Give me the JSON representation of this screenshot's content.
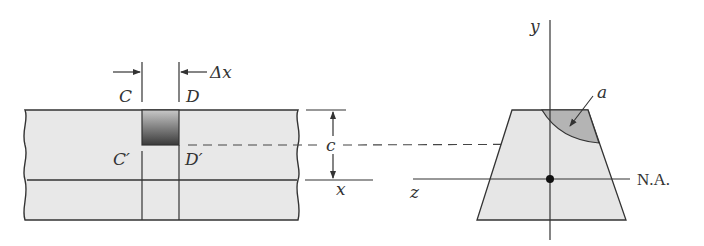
{
  "figure": {
    "type": "engineering diagram"
  },
  "beam": {
    "labels": {
      "C": "C",
      "D": "D",
      "C_prime": "C′",
      "D_prime": "D′",
      "delta_x": "Δx",
      "c": "c",
      "x_axis": "x"
    },
    "colors": {
      "fill": "#e8e8e8",
      "element_dark": "#3a3a3a",
      "element_light": "#c8c8c8",
      "stroke": "#333333"
    }
  },
  "cross_section": {
    "labels": {
      "y_axis": "y",
      "z_axis": "z",
      "area": "a",
      "neutral_axis": "N.A."
    },
    "colors": {
      "fill": "#e6e6e6",
      "area_fill": "#b4b4b4",
      "centroid": "#111111"
    }
  }
}
